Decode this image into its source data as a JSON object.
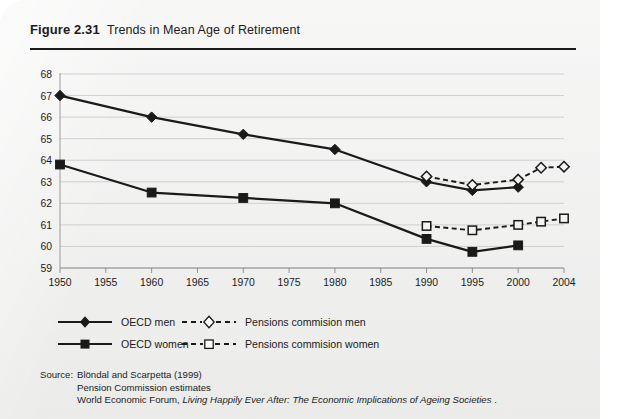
{
  "figure": {
    "label": "Figure 2.31",
    "title": "Trends in Mean Age of Retirement"
  },
  "source": {
    "label": "Source:",
    "lines": [
      "Blöndal and Scarpetta (1999)",
      "Pension Commission estimates"
    ],
    "wef_prefix": "World Economic Forum, ",
    "wef_italic": "Living Happily Ever After: The Economic Implications of Ageing Societies",
    "wef_suffix": " ."
  },
  "legend": {
    "items": [
      {
        "key": "oecd-men",
        "label": "OECD men",
        "marker": "filled-diamond",
        "line": "solid",
        "color": "#1a1a1a"
      },
      {
        "key": "oecd-women",
        "label": "OECD women",
        "marker": "filled-square",
        "line": "solid",
        "color": "#1a1a1a"
      },
      {
        "key": "pc-men",
        "label": "Pensions commision men",
        "marker": "open-diamond",
        "line": "dashed",
        "color": "#1a1a1a"
      },
      {
        "key": "pc-women",
        "label": "Pensions commision women",
        "marker": "open-square",
        "line": "dashed",
        "color": "#1a1a1a"
      }
    ]
  },
  "chart_data": {
    "type": "line",
    "title": "Trends in Mean Age of Retirement",
    "xlabel": "",
    "ylabel": "",
    "xlim": [
      1950,
      2004
    ],
    "ylim": [
      59,
      68
    ],
    "yticks": [
      59,
      60,
      61,
      62,
      63,
      64,
      65,
      66,
      67,
      68
    ],
    "xticks": [
      1950,
      1955,
      1960,
      1965,
      1970,
      1975,
      1980,
      1985,
      1990,
      1995,
      2000,
      2004
    ],
    "xtick_labels": [
      "1950",
      "1955",
      "1960",
      "1965",
      "1970",
      "1975",
      "1980",
      "1985",
      "1990",
      "1995",
      "2000",
      "2004"
    ],
    "ytick_labels": [
      "59",
      "60",
      "61",
      "62",
      "63",
      "64",
      "65",
      "66",
      "67",
      "68"
    ],
    "grid": "horizontal",
    "legend_position": "below",
    "series": [
      {
        "name": "OECD men",
        "marker": "filled-diamond",
        "line": "solid",
        "color": "#1a1a1a",
        "x": [
          1950,
          1960,
          1970,
          1980,
          1990,
          1995,
          2000
        ],
        "values": [
          67.0,
          66.0,
          65.2,
          64.5,
          63.0,
          62.6,
          62.75
        ]
      },
      {
        "name": "OECD women",
        "marker": "filled-square",
        "line": "solid",
        "color": "#1a1a1a",
        "x": [
          1950,
          1960,
          1970,
          1980,
          1990,
          1995,
          2000
        ],
        "values": [
          63.8,
          62.5,
          62.25,
          62.0,
          60.35,
          59.75,
          60.05
        ]
      },
      {
        "name": "Pensions commision men",
        "marker": "open-diamond",
        "line": "dashed",
        "color": "#1a1a1a",
        "x": [
          1990,
          1995,
          2000,
          2002,
          2004
        ],
        "values": [
          63.25,
          62.85,
          63.1,
          63.65,
          63.7
        ]
      },
      {
        "name": "Pensions commision women",
        "marker": "open-square",
        "line": "dashed",
        "color": "#1a1a1a",
        "x": [
          1990,
          1995,
          2000,
          2002,
          2004
        ],
        "values": [
          60.95,
          60.75,
          61.0,
          61.15,
          61.3
        ]
      }
    ]
  }
}
